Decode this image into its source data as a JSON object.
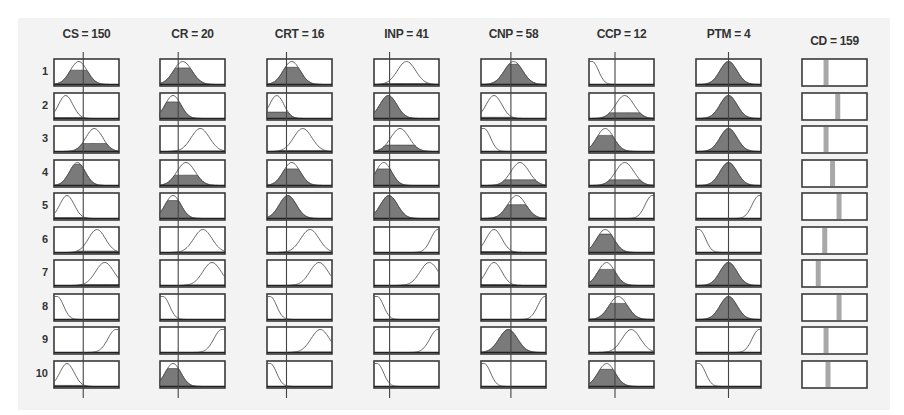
{
  "viewer": {
    "title": "Fuzzy rule viewer",
    "columns": [
      {
        "id": "cs",
        "title": "CS = 150",
        "value_pos": 0.45,
        "type": "input",
        "cells": [
          {
            "shape": "gauss",
            "c": 0.38,
            "w": 0.13,
            "fill": 0.62
          },
          {
            "shape": "gauss",
            "c": 0.18,
            "w": 0.11,
            "fill": 0.04
          },
          {
            "shape": "gauss",
            "c": 0.62,
            "w": 0.13,
            "fill": 0.35
          },
          {
            "shape": "gauss",
            "c": 0.36,
            "w": 0.12,
            "fill": 0.92
          },
          {
            "shape": "gauss",
            "c": 0.2,
            "w": 0.11,
            "fill": 0.04
          },
          {
            "shape": "gauss",
            "c": 0.66,
            "w": 0.13,
            "fill": 0.06
          },
          {
            "shape": "gauss",
            "c": 0.78,
            "w": 0.14,
            "fill": 0.04
          },
          {
            "shape": "z",
            "c": 0.05,
            "w": 0.2,
            "fill": 0.0
          },
          {
            "shape": "s",
            "c": 0.95,
            "w": 0.25,
            "fill": 0.0
          },
          {
            "shape": "gauss",
            "c": 0.2,
            "w": 0.11,
            "fill": 0.05
          }
        ]
      },
      {
        "id": "cr",
        "title": "CR = 20",
        "value_pos": 0.28,
        "type": "input",
        "cells": [
          {
            "shape": "gauss",
            "c": 0.35,
            "w": 0.14,
            "fill": 0.72
          },
          {
            "shape": "gauss",
            "c": 0.2,
            "w": 0.12,
            "fill": 0.72
          },
          {
            "shape": "gauss",
            "c": 0.62,
            "w": 0.14,
            "fill": 0.02
          },
          {
            "shape": "gauss",
            "c": 0.4,
            "w": 0.14,
            "fill": 0.45
          },
          {
            "shape": "gauss",
            "c": 0.2,
            "w": 0.12,
            "fill": 0.78
          },
          {
            "shape": "gauss",
            "c": 0.66,
            "w": 0.14,
            "fill": 0.02
          },
          {
            "shape": "gauss",
            "c": 0.8,
            "w": 0.14,
            "fill": 0.02
          },
          {
            "shape": "z",
            "c": 0.05,
            "w": 0.2,
            "fill": 0.0
          },
          {
            "shape": "s",
            "c": 0.95,
            "w": 0.25,
            "fill": 0.0
          },
          {
            "shape": "gauss",
            "c": 0.2,
            "w": 0.12,
            "fill": 0.78
          }
        ]
      },
      {
        "id": "crt",
        "title": "CRT = 16",
        "value_pos": 0.3,
        "type": "input",
        "cells": [
          {
            "shape": "gauss",
            "c": 0.38,
            "w": 0.13,
            "fill": 0.75
          },
          {
            "shape": "gauss",
            "c": 0.15,
            "w": 0.11,
            "fill": 0.28
          },
          {
            "shape": "gauss",
            "c": 0.55,
            "w": 0.14,
            "fill": 0.04
          },
          {
            "shape": "gauss",
            "c": 0.38,
            "w": 0.13,
            "fill": 0.72
          },
          {
            "shape": "gauss",
            "c": 0.32,
            "w": 0.13,
            "fill": 1.0
          },
          {
            "shape": "gauss",
            "c": 0.66,
            "w": 0.14,
            "fill": 0.02
          },
          {
            "shape": "gauss",
            "c": 0.8,
            "w": 0.14,
            "fill": 0.02
          },
          {
            "shape": "z",
            "c": 0.05,
            "w": 0.2,
            "fill": 0.0
          },
          {
            "shape": "gauss",
            "c": 0.82,
            "w": 0.14,
            "fill": 0.02
          },
          {
            "shape": "z",
            "c": 0.05,
            "w": 0.2,
            "fill": 0.0
          }
        ]
      },
      {
        "id": "inp",
        "title": "INP = 41",
        "value_pos": 0.24,
        "type": "input",
        "cells": [
          {
            "shape": "gauss",
            "c": 0.5,
            "w": 0.14,
            "fill": 0.04
          },
          {
            "shape": "gauss",
            "c": 0.22,
            "w": 0.13,
            "fill": 1.0
          },
          {
            "shape": "gauss",
            "c": 0.4,
            "w": 0.14,
            "fill": 0.28
          },
          {
            "shape": "gauss",
            "c": 0.15,
            "w": 0.12,
            "fill": 0.72
          },
          {
            "shape": "gauss",
            "c": 0.23,
            "w": 0.13,
            "fill": 1.0
          },
          {
            "shape": "s",
            "c": 0.98,
            "w": 0.22,
            "fill": 0.0
          },
          {
            "shape": "gauss",
            "c": 0.85,
            "w": 0.14,
            "fill": 0.02
          },
          {
            "shape": "z",
            "c": 0.05,
            "w": 0.2,
            "fill": 0.0
          },
          {
            "shape": "s",
            "c": 0.98,
            "w": 0.25,
            "fill": 0.0
          },
          {
            "shape": "z",
            "c": 0.05,
            "w": 0.2,
            "fill": 0.0
          }
        ]
      },
      {
        "id": "cnp",
        "title": "CNP = 58",
        "value_pos": 0.46,
        "type": "input",
        "cells": [
          {
            "shape": "gauss",
            "c": 0.5,
            "w": 0.14,
            "fill": 0.88
          },
          {
            "shape": "gauss",
            "c": 0.2,
            "w": 0.12,
            "fill": 0.05
          },
          {
            "shape": "z",
            "c": 0.05,
            "w": 0.2,
            "fill": 0.0
          },
          {
            "shape": "gauss",
            "c": 0.6,
            "w": 0.14,
            "fill": 0.25
          },
          {
            "shape": "gauss",
            "c": 0.55,
            "w": 0.14,
            "fill": 0.6
          },
          {
            "shape": "gauss",
            "c": 0.2,
            "w": 0.12,
            "fill": 0.04
          },
          {
            "shape": "gauss",
            "c": 0.2,
            "w": 0.12,
            "fill": 0.04
          },
          {
            "shape": "s",
            "c": 0.98,
            "w": 0.22,
            "fill": 0.0
          },
          {
            "shape": "gauss",
            "c": 0.42,
            "w": 0.14,
            "fill": 1.0
          },
          {
            "shape": "z",
            "c": 0.05,
            "w": 0.2,
            "fill": 0.0
          }
        ]
      },
      {
        "id": "ccp",
        "title": "CCP = 12",
        "value_pos": 0.4,
        "type": "input",
        "cells": [
          {
            "shape": "z",
            "c": 0.05,
            "w": 0.2,
            "fill": 0.0
          },
          {
            "shape": "gauss",
            "c": 0.55,
            "w": 0.14,
            "fill": 0.25
          },
          {
            "shape": "gauss",
            "c": 0.25,
            "w": 0.13,
            "fill": 0.7
          },
          {
            "shape": "gauss",
            "c": 0.55,
            "w": 0.14,
            "fill": 0.25
          },
          {
            "shape": "s",
            "c": 0.97,
            "w": 0.22,
            "fill": 0.0
          },
          {
            "shape": "gauss",
            "c": 0.25,
            "w": 0.13,
            "fill": 0.8
          },
          {
            "shape": "gauss",
            "c": 0.27,
            "w": 0.13,
            "fill": 0.7
          },
          {
            "shape": "gauss",
            "c": 0.45,
            "w": 0.14,
            "fill": 0.7
          },
          {
            "shape": "gauss",
            "c": 0.65,
            "w": 0.14,
            "fill": 0.03
          },
          {
            "shape": "gauss",
            "c": 0.27,
            "w": 0.13,
            "fill": 0.75
          }
        ]
      },
      {
        "id": "ptm",
        "title": "PTM = 4",
        "value_pos": 0.5,
        "type": "input",
        "cells": [
          {
            "shape": "gauss",
            "c": 0.5,
            "w": 0.13,
            "fill": 1.0
          },
          {
            "shape": "gauss",
            "c": 0.5,
            "w": 0.13,
            "fill": 1.0
          },
          {
            "shape": "gauss",
            "c": 0.5,
            "w": 0.13,
            "fill": 1.0
          },
          {
            "shape": "gauss",
            "c": 0.5,
            "w": 0.13,
            "fill": 1.0
          },
          {
            "shape": "s",
            "c": 0.97,
            "w": 0.22,
            "fill": 0.0
          },
          {
            "shape": "z",
            "c": 0.05,
            "w": 0.2,
            "fill": 0.0
          },
          {
            "shape": "gauss",
            "c": 0.5,
            "w": 0.13,
            "fill": 1.0
          },
          {
            "shape": "gauss",
            "c": 0.5,
            "w": 0.13,
            "fill": 1.0
          },
          {
            "shape": "s",
            "c": 0.97,
            "w": 0.22,
            "fill": 0.0
          },
          {
            "shape": "z",
            "c": 0.05,
            "w": 0.2,
            "fill": 0.0
          }
        ]
      },
      {
        "id": "cd",
        "title": "CD = 159",
        "type": "output",
        "cells": [
          {
            "bar": 0.37
          },
          {
            "bar": 0.55
          },
          {
            "bar": 0.37
          },
          {
            "bar": 0.47
          },
          {
            "bar": 0.57
          },
          {
            "bar": 0.35
          },
          {
            "bar": 0.25
          },
          {
            "bar": 0.57
          },
          {
            "bar": 0.37
          },
          {
            "bar": 0.4
          }
        ]
      }
    ],
    "row_labels": [
      "1",
      "2",
      "3",
      "4",
      "5",
      "6",
      "7",
      "8",
      "9",
      "10"
    ],
    "colors": {
      "background": "#f3f3f3",
      "box_fill": "#ffffff",
      "box_border": "#3a3a3a",
      "mf_fill": "#7a7a7a",
      "mf_line": "#555555",
      "value_line": "#444444",
      "output_bar": "#a8a8a8",
      "text": "#333333"
    }
  }
}
